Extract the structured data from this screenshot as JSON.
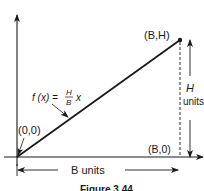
{
  "diagram": {
    "points": {
      "origin": "(0,0)",
      "top_right": "(B,H)",
      "bottom_right": "(B,0)"
    },
    "function": {
      "lhs": "f (x) =",
      "numerator": "H",
      "denominator": "B",
      "var": "x"
    },
    "height_dim": {
      "symbol": "H",
      "unit": "units"
    },
    "width_dim": {
      "label": "B units"
    },
    "caption": "Figure 3.44",
    "colors": {
      "ink": "#1a1a1a",
      "background": "#ffffff"
    }
  }
}
